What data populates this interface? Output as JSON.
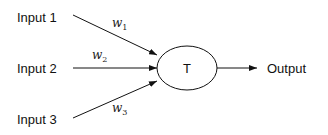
{
  "diagram": {
    "title": "",
    "inputs": [
      {
        "label": "Input 1",
        "weight": "w",
        "weight_sub": "1"
      },
      {
        "label": "Input 2",
        "weight": "w",
        "weight_sub": "2"
      },
      {
        "label": "Input 3",
        "weight": "w",
        "weight_sub": "3"
      }
    ],
    "node": {
      "label": "T"
    },
    "output": {
      "label": "Output"
    },
    "colors": {
      "stroke": "#111111",
      "background": "#ffffff"
    }
  }
}
